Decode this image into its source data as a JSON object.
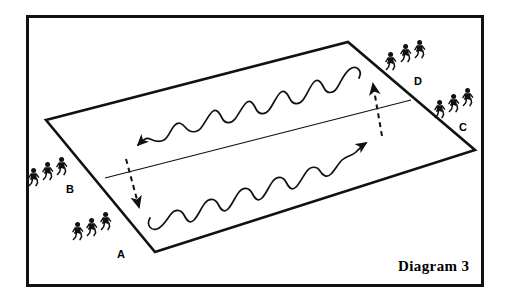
{
  "caption": {
    "text": "Diagram 3",
    "x": 398,
    "y": 258
  },
  "frame": {
    "color": "#111111",
    "thickness": 3
  },
  "field": {
    "name": "playing-area",
    "corners": [
      [
        46,
        120
      ],
      [
        348,
        42
      ],
      [
        475,
        150
      ],
      [
        155,
        252
      ]
    ],
    "stroke": "#111111",
    "stroke_width": 2.6,
    "center_line": {
      "from": [
        105,
        178
      ],
      "to": [
        411,
        100
      ],
      "stroke_width": 1.2
    }
  },
  "paths": [
    {
      "name": "upper-wavy-run",
      "direction": "right-to-left",
      "arrow_at": [
        131,
        148
      ],
      "d": "M 359,78 C 363,70 356,65 350,69 C 344,73 341,82 337,88 C 333,94 327,94 324,88 C 321,82 318,78 314,82 C 310,86 307,95 303,100 C 299,105 293,105 290,99 C 287,93 284,89 280,93 C 276,97 273,105 269,110 C 265,115 259,115 256,109 C 253,103 250,99 246,103 C 242,107 239,114 235,119 C 231,124 225,124 222,118 C 219,112 216,108 212,112 C 208,116 205,123 201,128 C 197,133 190,133 186,128 C 182,123 178,121 174,126 C 170,131 168,138 164,140 C 160,142 154,141 150,139 C 146,137 142,141 138,145"
    },
    {
      "name": "lower-wavy-run",
      "direction": "left-to-right",
      "arrow_at": [
        370,
        141
      ],
      "d": "M 150,218 C 146,225 151,231 157,229 C 163,227 167,219 171,214 C 175,209 181,209 184,215 C 187,221 190,224 194,220 C 198,216 201,208 205,203 C 209,198 215,198 218,204 C 221,210 224,213 228,209 C 232,205 235,197 239,192 C 243,187 249,187 252,193 C 255,199 258,202 262,198 C 266,194 269,186 273,181 C 277,176 283,176 286,182 C 289,188 292,191 296,187 C 300,183 303,176 307,171 C 311,166 317,166 320,171 C 323,176 327,178 331,174 C 335,170 338,164 342,160 C 346,156 352,156 356,152 C 360,148 363,145 366,143"
    }
  ],
  "dashed_arrows": [
    {
      "name": "dashed-arrow-up",
      "from": [
        382,
        136
      ],
      "to": [
        373,
        84
      ]
    },
    {
      "name": "dashed-arrow-down",
      "from": [
        126,
        159
      ],
      "to": [
        139,
        207
      ]
    }
  ],
  "groups": [
    {
      "id": "A",
      "label": "A",
      "label_pos": [
        117,
        248
      ],
      "figures": [
        [
          72,
          222
        ],
        [
          86,
          218
        ],
        [
          100,
          212
        ]
      ]
    },
    {
      "id": "B",
      "label": "B",
      "label_pos": [
        66,
        183
      ],
      "figures": [
        [
          28,
          168
        ],
        [
          42,
          162
        ],
        [
          56,
          157
        ]
      ]
    },
    {
      "id": "C",
      "label": "C",
      "label_pos": [
        459,
        121
      ],
      "figures": [
        [
          434,
          100
        ],
        [
          448,
          94
        ],
        [
          462,
          88
        ]
      ]
    },
    {
      "id": "D",
      "label": "D",
      "label_pos": [
        414,
        75
      ],
      "figures": [
        [
          385,
          52
        ],
        [
          400,
          44
        ],
        [
          414,
          40
        ]
      ]
    }
  ]
}
